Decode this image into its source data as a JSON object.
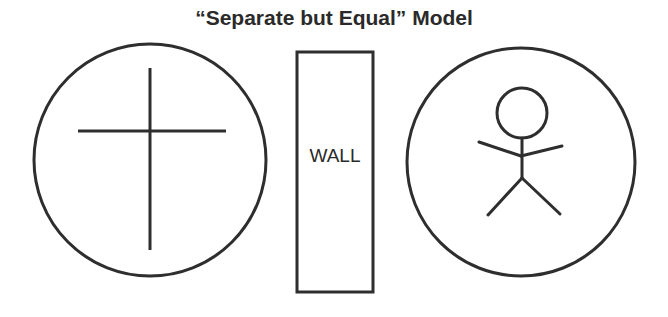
{
  "title": "“Separate but Equal” Model",
  "diagram": {
    "left_circle": {
      "symbol": "cross-icon",
      "cx": 150,
      "cy": 160,
      "r": 116
    },
    "wall": {
      "label": "WALL",
      "x": 297,
      "y": 52,
      "width": 76,
      "height": 240
    },
    "right_circle": {
      "symbol": "stick-figure-icon",
      "cx": 521,
      "cy": 162,
      "r": 114
    },
    "stroke_color": "#2e2e2e",
    "background_color": "#ffffff"
  }
}
